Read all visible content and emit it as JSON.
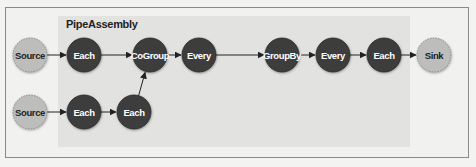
{
  "diagram": {
    "assembly_label": "PipeAssembly",
    "colors": {
      "pipe_node": "#3d3d3d",
      "tap_node": "#bdbdbb",
      "pipe_text": "#ffffff",
      "tap_text": "#222222",
      "edge": "#222222",
      "assembly_bg": "#e2e2e0",
      "frame_bg": "#f1f1ef"
    },
    "nodes": [
      {
        "id": "source1",
        "label": "Source",
        "kind": "tap",
        "x": 30,
        "y": 55
      },
      {
        "id": "each1",
        "label": "Each",
        "kind": "pipe",
        "x": 84,
        "y": 55
      },
      {
        "id": "cogroup",
        "label": "CoGroup",
        "kind": "pipe",
        "x": 150,
        "y": 55
      },
      {
        "id": "every1",
        "label": "Every",
        "kind": "pipe",
        "x": 199,
        "y": 55
      },
      {
        "id": "groupby",
        "label": "GroupBy",
        "kind": "pipe",
        "x": 282,
        "y": 55
      },
      {
        "id": "every2",
        "label": "Every",
        "kind": "pipe",
        "x": 333,
        "y": 55
      },
      {
        "id": "each2",
        "label": "Each",
        "kind": "pipe",
        "x": 384,
        "y": 55
      },
      {
        "id": "sink",
        "label": "Sink",
        "kind": "tap",
        "x": 434,
        "y": 55
      },
      {
        "id": "source2",
        "label": "Source",
        "kind": "tap",
        "x": 30,
        "y": 112
      },
      {
        "id": "each3",
        "label": "Each",
        "kind": "pipe",
        "x": 84,
        "y": 112
      },
      {
        "id": "each4",
        "label": "Each",
        "kind": "pipe",
        "x": 134,
        "y": 112
      }
    ],
    "edges": [
      [
        "source1",
        "each1"
      ],
      [
        "each1",
        "cogroup"
      ],
      [
        "cogroup",
        "every1"
      ],
      [
        "every1",
        "groupby"
      ],
      [
        "groupby",
        "every2"
      ],
      [
        "every2",
        "each2"
      ],
      [
        "each2",
        "sink"
      ],
      [
        "source2",
        "each3"
      ],
      [
        "each3",
        "each4"
      ],
      [
        "each4",
        "cogroup"
      ]
    ]
  }
}
